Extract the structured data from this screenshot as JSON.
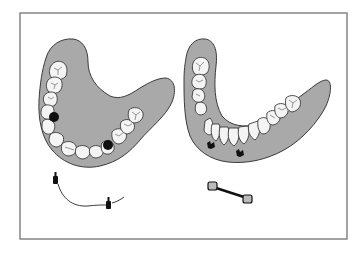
{
  "figure": {
    "type": "dental illustration",
    "colors": {
      "background": "#ffffff",
      "frame": "#7d7d7d",
      "gum": "#a9a9a9",
      "tooth": "#f4f4f4",
      "outline": "#3a3a3a",
      "implant": "#111111"
    },
    "panels": [
      {
        "id": "upper-arch",
        "label": "Upper overdenture with implant attachments",
        "components": [
          "gum-base",
          "teeth",
          "two-attachment-sockets",
          "ball-implants-with-connector-line"
        ]
      },
      {
        "id": "lower-arch",
        "label": "Lower overdenture with bar clip attachments",
        "components": [
          "gum-base",
          "teeth",
          "two-clip-housings",
          "bar-attachment"
        ]
      }
    ]
  }
}
